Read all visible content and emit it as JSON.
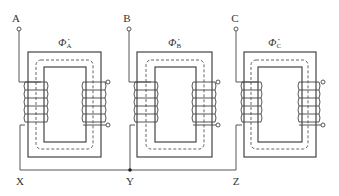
{
  "diagram": {
    "phases": [
      {
        "id": "A",
        "input_label": "A",
        "neutral_label": "X",
        "flux_symbol": "Φ̇",
        "flux_subscript": "A",
        "origin_x": 28
      },
      {
        "id": "B",
        "input_label": "B",
        "neutral_label": "Y",
        "flux_symbol": "Φ̇",
        "flux_subscript": "B",
        "origin_x": 137
      },
      {
        "id": "C",
        "input_label": "C",
        "neutral_label": "Z",
        "flux_symbol": "Φ̇",
        "flux_subscript": "C",
        "origin_x": 244
      }
    ],
    "primary_turns": 6,
    "secondary_turns": 6,
    "neutral_connection": "star point at Y",
    "colors": {
      "line": "#444444",
      "background": "#ffffff"
    }
  }
}
